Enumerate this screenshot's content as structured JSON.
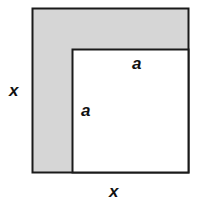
{
  "diagram": {
    "outer_square": {
      "side_label": "x",
      "fill": "#d6d6d6"
    },
    "inner_square": {
      "side_label": "a",
      "fill": "#ffffff"
    },
    "labels": {
      "outer_left": "x",
      "outer_bottom": "x",
      "inner_top": "a",
      "inner_left": "a"
    },
    "colors": {
      "stroke": "#1a1a1a",
      "shaded": "#d6d6d6"
    }
  }
}
